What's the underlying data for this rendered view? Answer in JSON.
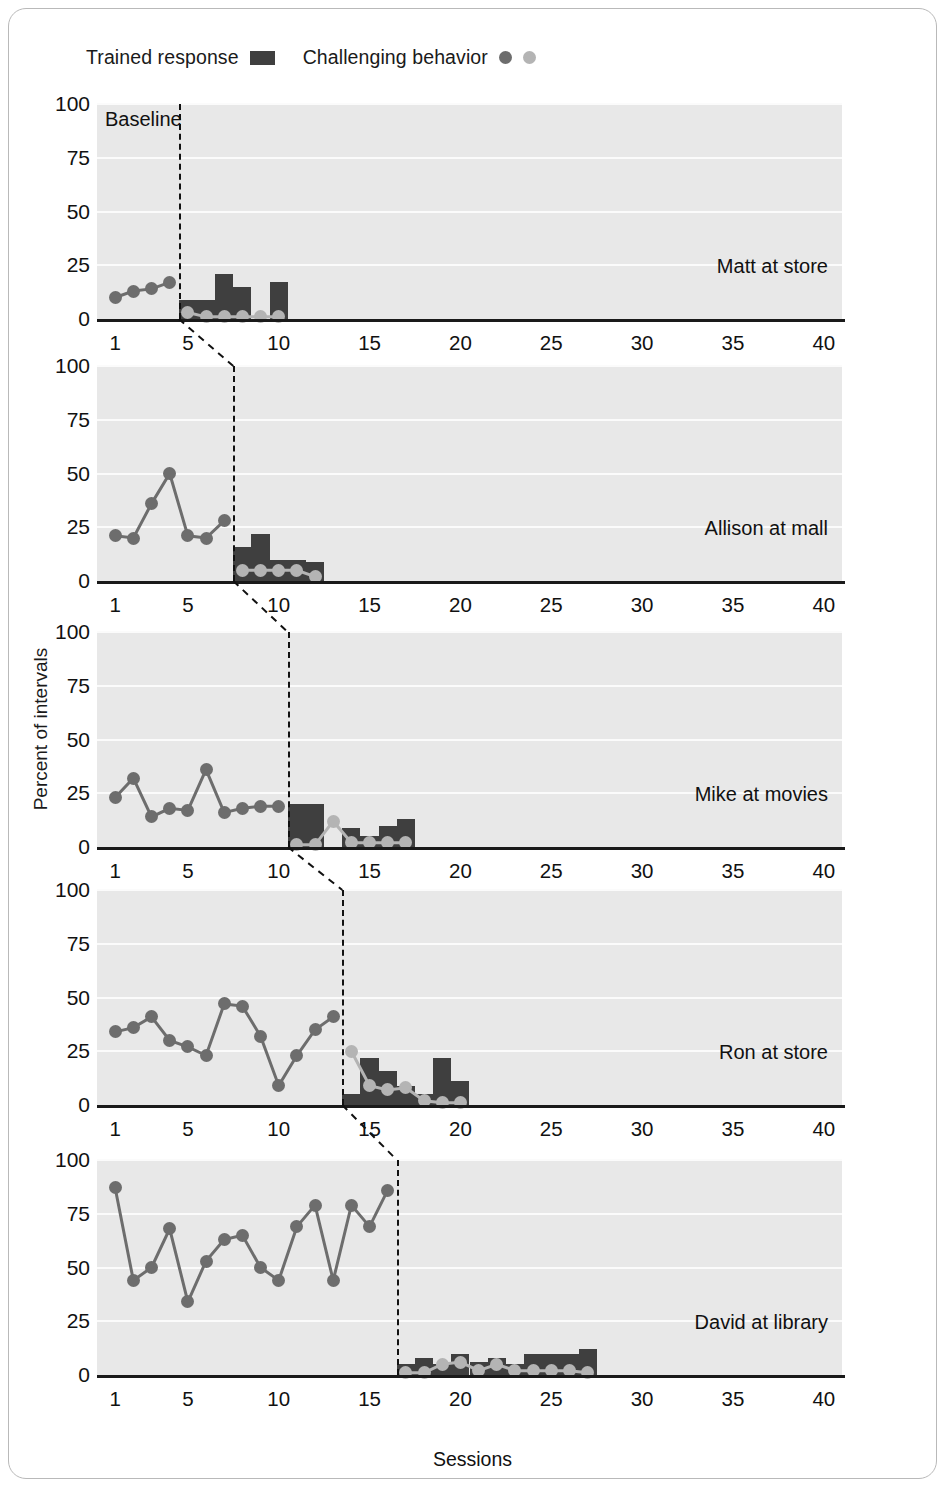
{
  "figure": {
    "y_axis_title": "Percent of intervals",
    "x_axis_title": "Sessions",
    "baseline_annotation": "Baseline"
  },
  "legend": {
    "items": [
      {
        "label": "Trained response",
        "marker": "bar-swatch",
        "color": "#3f3f3f"
      },
      {
        "label": "Challenging behavior",
        "marker": "dot-pair",
        "colors": [
          "#6d6d6d",
          "#b4b4b4"
        ]
      }
    ]
  },
  "axes": {
    "y_ticks": [
      "100",
      "75",
      "50",
      "25",
      "0"
    ],
    "y_values": [
      100,
      75,
      50,
      25,
      0
    ],
    "x_ticks": [
      "1",
      "5",
      "10",
      "15",
      "20",
      "25",
      "30",
      "35",
      "40"
    ],
    "x_values": [
      1,
      5,
      10,
      15,
      20,
      25,
      30,
      35,
      40
    ],
    "xlim": [
      0,
      41
    ],
    "ylim": [
      0,
      100
    ]
  },
  "colors": {
    "plot_background": "#e8e8e8",
    "gridline": "#fbfbfb",
    "bar": "#3f3f3f",
    "point_dark": "#6d6d6d",
    "point_light": "#b4b4b4",
    "axis": "#1a1a1a",
    "frame": "#b9b9b9"
  },
  "panels": [
    {
      "title": "Matt at store"
    },
    {
      "title": "Allison at mall"
    },
    {
      "title": "Mike at movies"
    },
    {
      "title": "Ron at store"
    },
    {
      "title": "David at library"
    }
  ],
  "chart_data": {
    "type": "line",
    "title": "",
    "subtitle": "Multiple baseline across participants",
    "xlabel": "Sessions",
    "ylabel": "Percent of intervals",
    "xlim": [
      0,
      41
    ],
    "ylim": [
      0,
      100
    ],
    "yticks": [
      0,
      25,
      50,
      75,
      100
    ],
    "xticks": [
      1,
      5,
      10,
      15,
      20,
      25,
      30,
      35,
      40
    ],
    "grid": true,
    "legend_position": "top-left",
    "legend": [
      "Trained response",
      "Challenging behavior"
    ],
    "annotations": [
      "Baseline"
    ],
    "panels": [
      {
        "name": "Matt at store",
        "phase_change_session": 4.5,
        "baseline": {
          "series_name": "Challenging behavior",
          "x": [
            1,
            2,
            3,
            4
          ],
          "values": [
            10,
            13,
            14,
            17
          ]
        },
        "intervention": {
          "bars": {
            "series_name": "Trained response",
            "x": [
              5,
              6,
              7,
              8,
              9,
              10
            ],
            "values": [
              9,
              9,
              21,
              15,
              0,
              17
            ]
          },
          "points": {
            "series_name": "Challenging behavior",
            "x": [
              5,
              6,
              7,
              8,
              9,
              10
            ],
            "values": [
              3,
              1,
              1,
              1,
              1,
              1
            ]
          }
        }
      },
      {
        "name": "Allison at mall",
        "phase_change_session": 7.5,
        "baseline": {
          "series_name": "Challenging behavior",
          "x": [
            1,
            2,
            3,
            4,
            5,
            6,
            7
          ],
          "values": [
            21,
            20,
            36,
            50,
            21,
            20,
            28
          ]
        },
        "intervention": {
          "bars": {
            "series_name": "Trained response",
            "x": [
              8,
              9,
              10,
              11,
              12
            ],
            "values": [
              16,
              22,
              10,
              10,
              9
            ]
          },
          "points": {
            "series_name": "Challenging behavior",
            "x": [
              8,
              9,
              10,
              11,
              12
            ],
            "values": [
              5,
              5,
              5,
              5,
              2
            ]
          }
        }
      },
      {
        "name": "Mike at movies",
        "phase_change_session": 10.5,
        "baseline": {
          "series_name": "Challenging behavior",
          "x": [
            1,
            2,
            3,
            4,
            5,
            6,
            7,
            8,
            9,
            10
          ],
          "values": [
            23,
            32,
            14,
            18,
            17,
            36,
            16,
            18,
            19,
            19
          ]
        },
        "intervention": {
          "bars": {
            "series_name": "Trained response",
            "x": [
              11,
              12,
              13,
              14,
              15,
              16,
              17
            ],
            "values": [
              20,
              20,
              0,
              9,
              5,
              10,
              13
            ]
          },
          "points": {
            "series_name": "Challenging behavior",
            "x": [
              11,
              12,
              13,
              14,
              15,
              16,
              17
            ],
            "values": [
              1,
              1,
              12,
              2,
              2,
              2,
              2
            ]
          }
        }
      },
      {
        "name": "Ron at store",
        "phase_change_session": 13.5,
        "baseline": {
          "series_name": "Challenging behavior",
          "x": [
            1,
            2,
            3,
            4,
            5,
            6,
            7,
            8,
            9,
            10,
            11,
            12,
            13
          ],
          "values": [
            34,
            36,
            41,
            30,
            27,
            23,
            47,
            46,
            32,
            9,
            23,
            35,
            41
          ]
        },
        "intervention": {
          "bars": {
            "series_name": "Trained response",
            "x": [
              14,
              15,
              16,
              17,
              18,
              19,
              20
            ],
            "values": [
              5,
              22,
              16,
              9,
              5,
              22,
              11
            ]
          },
          "points": {
            "series_name": "Challenging behavior",
            "x": [
              14,
              15,
              16,
              17,
              18,
              19,
              20
            ],
            "values": [
              25,
              9,
              7,
              8,
              2,
              1,
              1
            ]
          }
        }
      },
      {
        "name": "David at library",
        "phase_change_session": 16.5,
        "baseline": {
          "series_name": "Challenging behavior",
          "x": [
            1,
            2,
            3,
            4,
            5,
            6,
            7,
            8,
            9,
            10,
            11,
            12,
            13,
            14,
            15,
            16
          ],
          "values": [
            87,
            44,
            50,
            68,
            34,
            53,
            63,
            65,
            50,
            44,
            69,
            79,
            44,
            79,
            69,
            86
          ]
        },
        "intervention": {
          "bars": {
            "series_name": "Trained response",
            "x": [
              17,
              18,
              19,
              20,
              21,
              22,
              23,
              24,
              25,
              26,
              27
            ],
            "values": [
              5,
              8,
              5,
              10,
              6,
              8,
              5,
              10,
              10,
              10,
              12
            ]
          },
          "points": {
            "series_name": "Challenging behavior",
            "x": [
              17,
              18,
              19,
              20,
              21,
              22,
              23,
              24,
              25,
              26,
              27
            ],
            "values": [
              1,
              1,
              5,
              6,
              2,
              5,
              2,
              2,
              2,
              2,
              1
            ]
          }
        }
      }
    ]
  }
}
